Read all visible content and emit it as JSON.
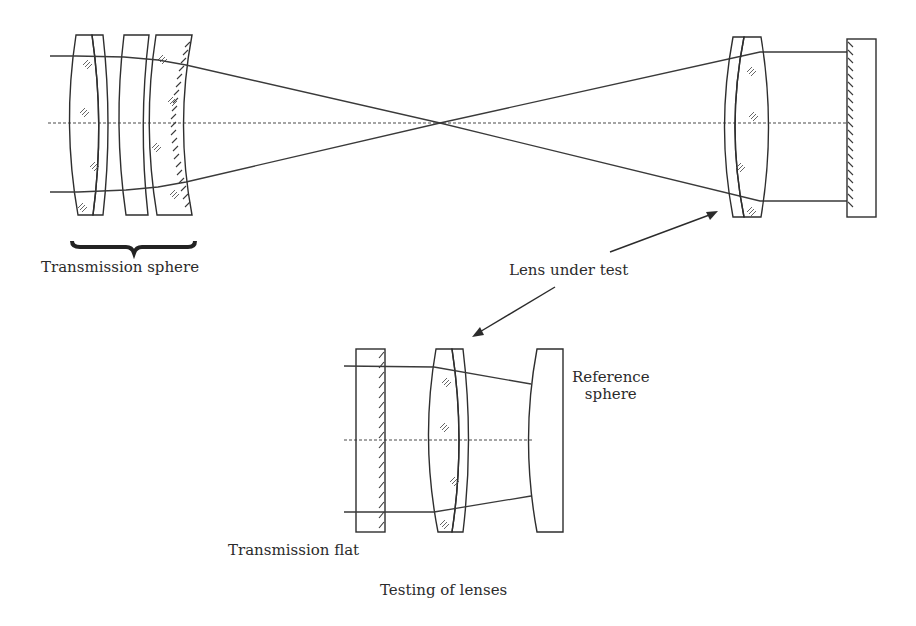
{
  "figure": {
    "caption": "Testing of lenses",
    "upper_setup": {
      "labels": {
        "transmission_sphere": "Transmission sphere",
        "lens_under_test": "Lens under test"
      }
    },
    "lower_setup": {
      "labels": {
        "reference_sphere_line1": "Reference",
        "reference_sphere_line2": "sphere",
        "transmission_flat": "Transmission flat"
      }
    }
  }
}
